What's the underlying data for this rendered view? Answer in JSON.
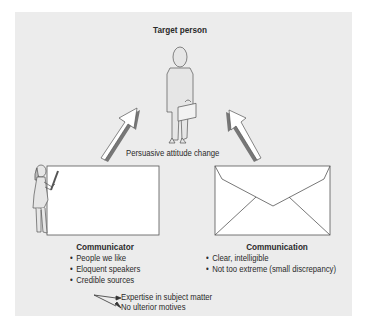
{
  "target": {
    "label": "Target person"
  },
  "center_label": "Persuasive attitude change",
  "communicator": {
    "title": "Communicator",
    "items": [
      "People we like",
      "Eloquent speakers",
      "Credible sources"
    ],
    "sub_items": [
      "Expertise in subject matter",
      "No ulterior motives"
    ]
  },
  "communication": {
    "title": "Communication",
    "items": [
      "Clear, intelligible",
      "Not too extreme (small discrepancy)"
    ]
  },
  "colors": {
    "panel": "#ececec",
    "line": "#555555",
    "arrow_shadow": "#777777",
    "fill": "#ffffff"
  }
}
